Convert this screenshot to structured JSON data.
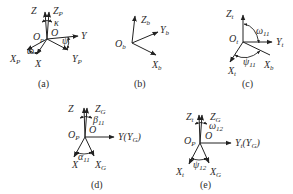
{
  "figure": {
    "panels": [
      {
        "id": "a",
        "caption": "(a)",
        "axes": [
          "Z",
          "Zp",
          "Y",
          "Yp",
          "X",
          "Xp"
        ],
        "origins": [
          "Op",
          "O"
        ],
        "angles": [
          "κ",
          "ω",
          "ψ"
        ]
      },
      {
        "id": "b",
        "caption": "(b)",
        "axes": [
          "Zb",
          "Yb",
          "Xb"
        ],
        "origins": [
          "Ob"
        ],
        "angles": []
      },
      {
        "id": "c",
        "caption": "(c)",
        "axes": [
          "Zt",
          "Yt",
          "Xt",
          "Xb"
        ],
        "origins": [
          "Ot"
        ],
        "angles": [
          "ω11",
          "ψ11"
        ]
      },
      {
        "id": "d",
        "caption": "(d)",
        "axes": [
          "Z",
          "ZG",
          "Y(YG)",
          "X",
          "XG"
        ],
        "origins": [
          "OP",
          "O"
        ],
        "angles": [
          "β11",
          "α11"
        ]
      },
      {
        "id": "e",
        "caption": "(e)",
        "axes": [
          "Zt",
          "ZG",
          "Yt(YG)",
          "Xt",
          "XG"
        ],
        "origins": [
          "OP",
          "O"
        ],
        "angles": [
          "ω12",
          "ψ12"
        ]
      }
    ]
  },
  "labels": {
    "a": {
      "z": "Z",
      "zp": "Z",
      "zp_sub": "P",
      "kappa": "κ",
      "op": "O",
      "op_sub": "p",
      "o": "O",
      "y": "Y",
      "psi": "ψ",
      "yp": "Y",
      "yp_sub": "P",
      "xp": "X",
      "xp_sub": "P",
      "omega": "ω",
      "x": "X",
      "cap": "(a)"
    },
    "b": {
      "zb": "Z",
      "zb_sub": "b",
      "ob": "O",
      "ob_sub": "b",
      "yb": "Y",
      "yb_sub": "b",
      "xb": "X",
      "xb_sub": "b",
      "cap": "(b)"
    },
    "c": {
      "zt": "Z",
      "zt_sub": "t",
      "ot": "O",
      "ot_sub": "t",
      "omega": "ω",
      "omega_sub": "11",
      "yt": "Y",
      "yt_sub": "t",
      "xt": "X",
      "xt_sub": "t",
      "psi": "ψ",
      "psi_sub": "11",
      "xb": "X",
      "xb_sub": "b",
      "cap": "(c)"
    },
    "d": {
      "z": "Z",
      "zg": "Z",
      "zg_sub": "G",
      "beta": "β",
      "beta_sub": "11",
      "op": "O",
      "op_sub": "P",
      "o": "O",
      "y": "Y(Y",
      "y_sub": "G",
      "y_close": ")",
      "alpha": "α",
      "alpha_sub": "11",
      "x": "X",
      "xg": "X",
      "xg_sub": "G",
      "cap": "(d)"
    },
    "e": {
      "zt": "Z",
      "zt_sub": "t",
      "zg": "Z",
      "zg_sub": "G",
      "omega": "ω",
      "omega_sub": "12",
      "op": "O",
      "op_sub": "P",
      "o": "O",
      "yt": "Y",
      "yt_sub": "t",
      "yg_open": "(Y",
      "yg_sub": "G",
      "yg_close": ")",
      "xt": "X",
      "xt_sub": "t",
      "psi": "ψ",
      "psi_sub": "12",
      "xg": "X",
      "xg_sub": "G",
      "cap": "(e)"
    }
  },
  "colors": {
    "ink": "#222222",
    "background": "#ffffff"
  }
}
